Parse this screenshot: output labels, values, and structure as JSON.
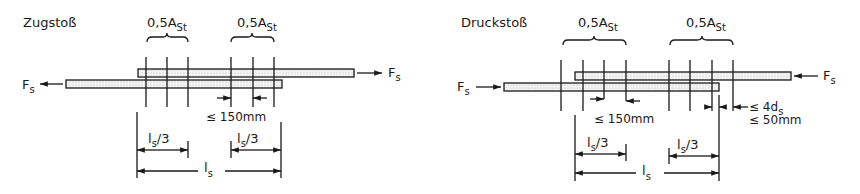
{
  "diagrams": [
    {
      "title": "Zugstoß",
      "force_label": "F",
      "force_sub": "s",
      "group_labels": [
        {
          "main": "0,5A",
          "sub": "St"
        },
        {
          "main": "0,5A",
          "sub": "St"
        }
      ],
      "spacing_label": "≤ 150mm",
      "third_label_main": "l",
      "third_label_sub": "s",
      "third_label_tail": "/3",
      "length_label_main": "l",
      "length_label_sub": "s",
      "force_direction": "tension"
    },
    {
      "title": "Druckstoß",
      "force_label": "F",
      "force_sub": "s",
      "group_labels": [
        {
          "main": "0,5A",
          "sub": "St"
        },
        {
          "main": "0,5A",
          "sub": "St"
        }
      ],
      "spacing_label": "≤ 150mm",
      "end_label_1_main": "≤ 4d",
      "end_label_1_sub": "s",
      "end_label_2": "≤ 50mm",
      "third_label_main": "l",
      "third_label_sub": "s",
      "third_label_tail": "/3",
      "length_label_main": "l",
      "length_label_sub": "s",
      "force_direction": "compression"
    }
  ]
}
